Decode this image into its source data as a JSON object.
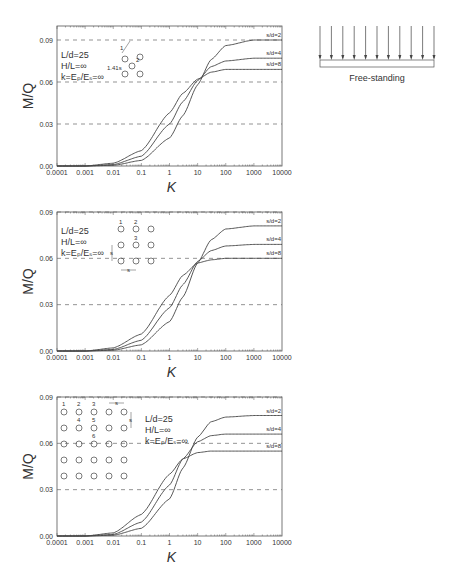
{
  "diagram": {
    "caption": "Free-standing",
    "arrow_count": 11
  },
  "chart_data": [
    {
      "type": "line",
      "title": "",
      "xlabel": "K",
      "ylabel": "M/Q",
      "xscale": "log",
      "xlim": [
        0.0001,
        10000
      ],
      "ylim": [
        0.0,
        0.09
      ],
      "xticks": [
        "0.0001",
        "0.001",
        "0.01",
        "0.1",
        "1",
        "10",
        "100",
        "1000",
        "10000"
      ],
      "yticks": [
        "0.00",
        "0.03",
        "0.06",
        "0.09"
      ],
      "gridlines": "dashed horizontal at 0.03, 0.06, 0.09",
      "annotations": [
        "L/d=25",
        "H/L=∞",
        "k=Eₚ/Eₛ=∞",
        "1.41s",
        "1",
        "2"
      ],
      "group_layout": "3-pile (triangular)",
      "x": [
        0.0001,
        0.001,
        0.01,
        0.1,
        1,
        3,
        10,
        30,
        100,
        1000,
        10000
      ],
      "series": [
        {
          "name": "s/d=2",
          "values": [
            0.0,
            0.0,
            0.0005,
            0.004,
            0.02,
            0.036,
            0.058,
            0.076,
            0.086,
            0.09,
            0.09
          ]
        },
        {
          "name": "s/d=4",
          "values": [
            0.0,
            0.0,
            0.001,
            0.007,
            0.03,
            0.046,
            0.061,
            0.071,
            0.075,
            0.077,
            0.077
          ]
        },
        {
          "name": "s/d=8",
          "values": [
            0.0,
            0.0,
            0.002,
            0.011,
            0.038,
            0.052,
            0.062,
            0.067,
            0.069,
            0.069,
            0.069
          ]
        }
      ]
    },
    {
      "type": "line",
      "title": "",
      "xlabel": "K",
      "ylabel": "M/Q",
      "xscale": "log",
      "xlim": [
        0.0001,
        10000
      ],
      "ylim": [
        0.0,
        0.09
      ],
      "xticks": [
        "0.0001",
        "0.001",
        "0.01",
        "0.1",
        "1",
        "10",
        "100",
        "1000",
        "10000"
      ],
      "yticks": [
        "0.00",
        "0.03",
        "0.06",
        "0.09"
      ],
      "gridlines": "dashed horizontal at 0.03, 0.06, 0.09",
      "annotations": [
        "L/d=25",
        "H/L=∞",
        "k=Eₚ/Eₛ=∞",
        "1",
        "2",
        "3",
        "s",
        "s"
      ],
      "group_layout": "3x3 grid",
      "x": [
        0.0001,
        0.001,
        0.01,
        0.1,
        1,
        3,
        10,
        30,
        100,
        1000,
        10000
      ],
      "series": [
        {
          "name": "s/d=2",
          "values": [
            0.0,
            0.0,
            0.0005,
            0.004,
            0.019,
            0.035,
            0.057,
            0.072,
            0.079,
            0.081,
            0.081
          ]
        },
        {
          "name": "s/d=4",
          "values": [
            0.0,
            0.0,
            0.001,
            0.007,
            0.028,
            0.043,
            0.058,
            0.065,
            0.068,
            0.069,
            0.069
          ]
        },
        {
          "name": "s/d=8",
          "values": [
            0.0,
            0.0,
            0.002,
            0.011,
            0.036,
            0.049,
            0.057,
            0.059,
            0.06,
            0.06,
            0.06
          ]
        }
      ]
    },
    {
      "type": "line",
      "title": "",
      "xlabel": "K",
      "ylabel": "M/Q",
      "xscale": "log",
      "xlim": [
        0.0001,
        10000
      ],
      "ylim": [
        0.0,
        0.09
      ],
      "xticks": [
        "0.0001",
        "0.001",
        "0.01",
        "0.1",
        "1",
        "10",
        "100",
        "1000",
        "10000"
      ],
      "yticks": [
        "0.00",
        "0.03",
        "0.06",
        "0.09"
      ],
      "gridlines": "dashed horizontal at 0.03, 0.06, 0.09",
      "annotations": [
        "L/d=25",
        "H/L=∞",
        "k=Eₚ/Eₛ=∞",
        "1",
        "2",
        "3",
        "4",
        "5",
        "6",
        "s",
        "s"
      ],
      "group_layout": "5x5 grid",
      "x": [
        0.0001,
        0.001,
        0.01,
        0.1,
        1,
        3,
        10,
        30,
        100,
        1000,
        10000
      ],
      "series": [
        {
          "name": "s/d=2",
          "values": [
            0.0,
            0.0,
            0.0005,
            0.005,
            0.024,
            0.044,
            0.064,
            0.074,
            0.077,
            0.078,
            0.078
          ]
        },
        {
          "name": "s/d=4",
          "values": [
            0.0,
            0.0,
            0.001,
            0.009,
            0.033,
            0.05,
            0.061,
            0.065,
            0.066,
            0.066,
            0.066
          ]
        },
        {
          "name": "s/d=8",
          "values": [
            0.0,
            0.0,
            0.002,
            0.014,
            0.04,
            0.05,
            0.054,
            0.055,
            0.055,
            0.055,
            0.055
          ]
        }
      ]
    }
  ]
}
